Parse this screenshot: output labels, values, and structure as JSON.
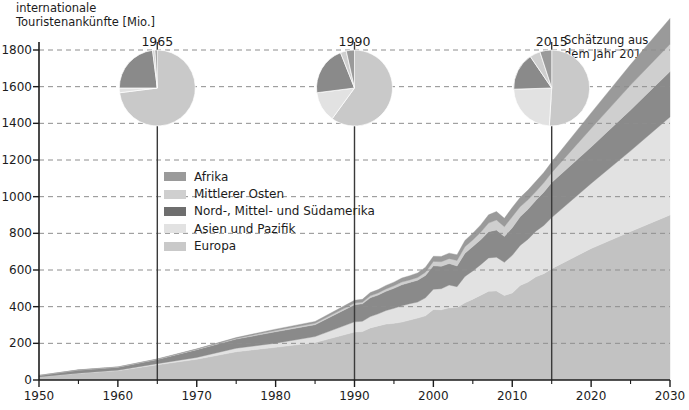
{
  "chart_data": {
    "type": "area",
    "title": "",
    "ylabel": "internationale\nTouristenankünfte [Mio.]",
    "xlabel": "",
    "xlim": [
      1950,
      2030
    ],
    "ylim": [
      0,
      1800
    ],
    "grid": true,
    "legend_position": "inside-left",
    "annotation": "Schätzung aus\ndem Jahr 2010",
    "forecast_start_year": 2015,
    "xticks": [
      1950,
      1960,
      1970,
      1980,
      1990,
      2000,
      2010,
      2020,
      2030
    ],
    "xminorticks": [
      1955,
      1965,
      1975,
      1985,
      1995,
      2005,
      2015,
      2025
    ],
    "yticks": [
      0,
      200,
      400,
      600,
      800,
      1000,
      1200,
      1400,
      1600,
      1800
    ],
    "marker_years": [
      1965,
      1990,
      2015
    ],
    "stack_order_bottom_to_top": [
      "Europa",
      "Asien und Pazifik",
      "Nord-, Mittel- und Südamerika",
      "Mittlerer Osten",
      "Afrika"
    ],
    "series": [
      {
        "name": "Europa",
        "color": "#c2c2c2",
        "x": [
          1950,
          1955,
          1960,
          1965,
          1970,
          1975,
          1980,
          1985,
          1990,
          1991,
          1992,
          1993,
          1994,
          1995,
          1996,
          1997,
          1998,
          1999,
          2000,
          2001,
          2002,
          2003,
          2004,
          2005,
          2006,
          2007,
          2008,
          2009,
          2010,
          2011,
          2012,
          2013,
          2014,
          2015,
          2020,
          2025,
          2030
        ],
        "values": [
          16.8,
          36,
          50.4,
          83,
          113,
          154,
          178,
          204,
          261.5,
          264,
          284,
          295,
          305,
          309,
          316,
          327,
          338,
          350,
          385,
          383,
          394,
          396,
          421,
          441,
          462,
          484,
          486,
          461,
          475,
          516,
          534,
          563,
          580,
          607,
          717,
          810,
          900
        ]
      },
      {
        "name": "Asien und Pazifik",
        "color": "#e2e2e2",
        "x": [
          1950,
          1955,
          1960,
          1965,
          1970,
          1975,
          1980,
          1985,
          1990,
          1991,
          1992,
          1993,
          1994,
          1995,
          1996,
          1997,
          1998,
          1999,
          2000,
          2001,
          2002,
          2003,
          2004,
          2005,
          2006,
          2007,
          2008,
          2009,
          2010,
          2011,
          2012,
          2013,
          2014,
          2015,
          2020,
          2025,
          2030
        ],
        "values": [
          0.2,
          1.3,
          2.9,
          6.2,
          10.2,
          19.1,
          23,
          32.9,
          55.8,
          56.5,
          62,
          66,
          74,
          82,
          89,
          89,
          87,
          98,
          110,
          115,
          124,
          113,
          144,
          154,
          167,
          182,
          184,
          181,
          205,
          218,
          234,
          249,
          263,
          279,
          355,
          440,
          535
        ]
      },
      {
        "name": "Nord-, Mittel- und Südamerika",
        "color": "#8a8a8a",
        "x": [
          1950,
          1955,
          1960,
          1965,
          1970,
          1975,
          1980,
          1985,
          1990,
          1991,
          1992,
          1993,
          1994,
          1995,
          1996,
          1997,
          1998,
          1999,
          2000,
          2001,
          2002,
          2003,
          2004,
          2005,
          2006,
          2007,
          2008,
          2009,
          2010,
          2011,
          2012,
          2013,
          2014,
          2015,
          2020,
          2025,
          2030
        ],
        "values": [
          7.5,
          16.7,
          16.7,
          22.9,
          42.3,
          50,
          62,
          65,
          92.8,
          95,
          102,
          102,
          105,
          109,
          114,
          116,
          119,
          122,
          128,
          122,
          117,
          113,
          126,
          133,
          136,
          143,
          148,
          141,
          150,
          156,
          163,
          168,
          181,
          191,
          199,
          223,
          248
        ]
      },
      {
        "name": "Mittlerer Osten",
        "color": "#cfcfcf",
        "x": [
          1950,
          1955,
          1960,
          1965,
          1970,
          1975,
          1980,
          1985,
          1990,
          1991,
          1992,
          1993,
          1994,
          1995,
          1996,
          1997,
          1998,
          1999,
          2000,
          2001,
          2002,
          2003,
          2004,
          2005,
          2006,
          2007,
          2008,
          2009,
          2010,
          2011,
          2012,
          2013,
          2014,
          2015,
          2020,
          2025,
          2030
        ],
        "values": [
          0.2,
          0.6,
          0.6,
          1.4,
          1.9,
          3.5,
          7.1,
          7.5,
          9.6,
          8.5,
          11,
          12,
          13,
          13.7,
          15,
          14,
          15,
          18,
          24,
          25,
          27,
          30,
          36,
          36,
          41,
          47,
          55,
          53,
          61,
          55,
          52,
          48,
          52,
          54,
          101,
          136,
          149
        ]
      },
      {
        "name": "Afrika",
        "color": "#9a9a9a",
        "x": [
          1950,
          1955,
          1960,
          1965,
          1970,
          1975,
          1980,
          1985,
          1990,
          1991,
          1992,
          1993,
          1994,
          1995,
          1996,
          1997,
          1998,
          1999,
          2000,
          2001,
          2002,
          2003,
          2004,
          2005,
          2006,
          2007,
          2008,
          2009,
          2010,
          2011,
          2012,
          2013,
          2014,
          2015,
          2020,
          2025,
          2030
        ],
        "values": [
          0.5,
          0.8,
          0.8,
          1.4,
          2.4,
          4.7,
          7.2,
          9.7,
          15.2,
          16,
          18,
          18,
          19,
          20,
          22,
          23,
          25,
          27,
          28,
          29,
          30,
          31,
          34,
          37,
          40,
          45,
          46,
          46,
          50,
          50,
          53,
          56,
          56,
          58,
          85,
          112,
          140
        ]
      }
    ]
  },
  "pies": [
    {
      "year": "1965",
      "slices": [
        {
          "name": "Europa",
          "value": 73.0,
          "color": "#c9c9c9"
        },
        {
          "name": "Asien und Pazifik",
          "value": 2.0,
          "color": "#e2e2e2"
        },
        {
          "name": "Nord-, Mittel- und Südamerika",
          "value": 23.0,
          "color": "#8a8a8a"
        },
        {
          "name": "Mittlerer Osten",
          "value": 1.0,
          "color": "#cfcfcf"
        },
        {
          "name": "Afrika",
          "value": 1.0,
          "color": "#9a9a9a"
        }
      ]
    },
    {
      "year": "1990",
      "slices": [
        {
          "name": "Europa",
          "value": 60.0,
          "color": "#c9c9c9"
        },
        {
          "name": "Asien und Pazifik",
          "value": 13.0,
          "color": "#e2e2e2"
        },
        {
          "name": "Nord-, Mittel- und Südamerika",
          "value": 21.0,
          "color": "#8a8a8a"
        },
        {
          "name": "Mittlerer Osten",
          "value": 2.5,
          "color": "#cfcfcf"
        },
        {
          "name": "Afrika",
          "value": 3.5,
          "color": "#9a9a9a"
        }
      ]
    },
    {
      "year": "2015",
      "slices": [
        {
          "name": "Europa",
          "value": 51.0,
          "color": "#c9c9c9"
        },
        {
          "name": "Asien und Pazifik",
          "value": 23.5,
          "color": "#e2e2e2"
        },
        {
          "name": "Nord-, Mittel- und Südamerika",
          "value": 16.0,
          "color": "#8a8a8a"
        },
        {
          "name": "Mittlerer Osten",
          "value": 4.5,
          "color": "#cfcfcf"
        },
        {
          "name": "Afrika",
          "value": 5.0,
          "color": "#9a9a9a"
        }
      ]
    }
  ],
  "legend": {
    "items": [
      {
        "label": "Afrika",
        "color": "#9a9a9a"
      },
      {
        "label": "Mittlerer Osten",
        "color": "#cfcfcf"
      },
      {
        "label": "Nord-, Mittel- und Südamerika",
        "color": "#6e6e6e"
      },
      {
        "label": "Asien und Pazifik",
        "color": "#e2e2e2"
      },
      {
        "label": "Europa",
        "color": "#c9c9c9"
      }
    ]
  },
  "style": {
    "axis_color": "#1c1c1c",
    "grid_color": "#8e8e8e",
    "marker_line_color": "#3a3a3a",
    "background": "#ffffff"
  }
}
